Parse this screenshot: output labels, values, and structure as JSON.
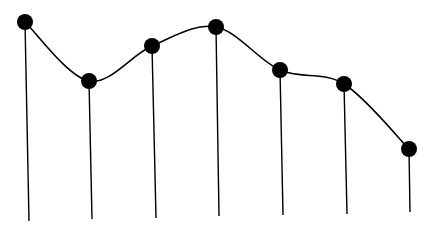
{
  "chart_data": {
    "type": "line",
    "title": "",
    "xlabel": "",
    "ylabel": "",
    "grid": false,
    "legend": null,
    "style": "smooth curve with filled circular markers and vertical drop lines",
    "line_color": "#000000",
    "marker_color": "#000000",
    "background": "#ffffff",
    "x": [
      1,
      2,
      3,
      4,
      5,
      6,
      7
    ],
    "values": [
      95,
      68,
      84,
      93,
      73,
      66,
      37
    ],
    "points_px": [
      {
        "x": 25,
        "y": 22,
        "base_x": 29,
        "base_y": 221
      },
      {
        "x": 89,
        "y": 81,
        "base_x": 92,
        "base_y": 219
      },
      {
        "x": 152,
        "y": 46,
        "base_x": 156,
        "base_y": 218
      },
      {
        "x": 216,
        "y": 27,
        "base_x": 219,
        "base_y": 216
      },
      {
        "x": 280,
        "y": 70,
        "base_x": 283,
        "base_y": 215
      },
      {
        "x": 344,
        "y": 84,
        "base_x": 347,
        "base_y": 214
      },
      {
        "x": 409,
        "y": 149,
        "base_x": 410,
        "base_y": 212
      }
    ],
    "marker_radius": 8
  }
}
